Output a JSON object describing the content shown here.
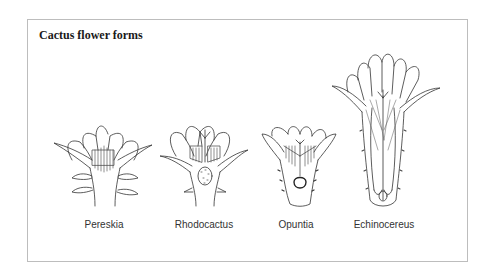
{
  "figure": {
    "title": "Cactus flower forms",
    "flowers": [
      {
        "name": "Pereskia",
        "center_x": 104
      },
      {
        "name": "Rhodocactus",
        "center_x": 204
      },
      {
        "name": "Opuntia",
        "center_x": 296
      },
      {
        "name": "Echinocereus",
        "center_x": 384
      }
    ]
  }
}
